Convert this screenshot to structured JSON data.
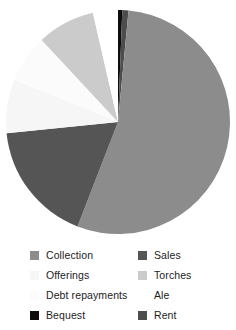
{
  "chart_data": {
    "type": "pie",
    "title": "",
    "subtitle": "",
    "xlabel": "",
    "ylabel": "",
    "grid": false,
    "legend_position": "bottom",
    "start_angle_deg": 90,
    "direction": "clockwise",
    "categories": [
      "Bequest",
      "Rent",
      "Collection",
      "Sales",
      "Offerings",
      "Debt repayments",
      "Torches",
      "Ale"
    ],
    "values": [
      0.6,
      0.9,
      54.4,
      17.5,
      7.8,
      6.9,
      8.3,
      3.6
    ],
    "units": "percent",
    "slices": [
      {
        "label": "Bequest",
        "value": 0.6,
        "angle_deg": 2.2,
        "color": "#0d0d0d"
      },
      {
        "label": "Rent",
        "value": 0.9,
        "angle_deg": 3.2,
        "color": "#4d4d4d"
      },
      {
        "label": "Collection",
        "value": 54.4,
        "angle_deg": 195.8,
        "color": "#8c8c8c"
      },
      {
        "label": "Sales",
        "value": 17.5,
        "angle_deg": 63.0,
        "color": "#555555"
      },
      {
        "label": "Offerings",
        "value": 7.8,
        "angle_deg": 28.0,
        "color": "#f6f6f6"
      },
      {
        "label": "Debt repayments",
        "value": 6.9,
        "angle_deg": 24.8,
        "color": "#fbfbfb"
      },
      {
        "label": "Torches",
        "value": 8.3,
        "angle_deg": 30.0,
        "color": "#cbcbcb"
      },
      {
        "label": "Ale",
        "value": 3.6,
        "angle_deg": 13.0,
        "color": "#ffffff"
      }
    ],
    "geometry": {
      "cx": 118,
      "cy": 122,
      "r": 112
    }
  },
  "legend": {
    "items": [
      {
        "label": "Collection",
        "color": "#8c8c8c"
      },
      {
        "label": "Sales",
        "color": "#555555"
      },
      {
        "label": "Offerings",
        "color": "#f6f6f6"
      },
      {
        "label": "Torches",
        "color": "#cbcbcb"
      },
      {
        "label": "Debt repayments",
        "color": "#fbfbfb"
      },
      {
        "label": "Ale",
        "color": "#ffffff"
      },
      {
        "label": "Bequest",
        "color": "#0d0d0d"
      },
      {
        "label": "Rent",
        "color": "#4d4d4d"
      }
    ]
  }
}
